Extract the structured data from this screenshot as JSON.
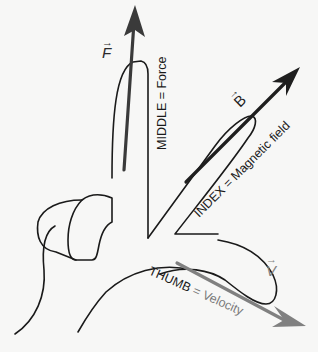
{
  "diagram": {
    "fingers": [
      {
        "id": "middle",
        "label": "MIDDLE = Force",
        "vector_symbol": "F",
        "vector_color": "#3a3a3a"
      },
      {
        "id": "index",
        "label": "INDEX = Magnetic field",
        "vector_symbol": "B",
        "vector_color": "#1f1f1f"
      },
      {
        "id": "thumb",
        "label_finger": "THUMB",
        "label_equals": " = ",
        "label_quantity": "Velocity",
        "vector_symbol": "V",
        "vector_color": "#808080"
      }
    ],
    "vector_arrow_glyph": "→",
    "colors": {
      "background": "#f7f7f6",
      "outline": "#1a1a1a",
      "text_dark": "#1a1a1a",
      "text_gray": "#7a7a7a"
    }
  }
}
